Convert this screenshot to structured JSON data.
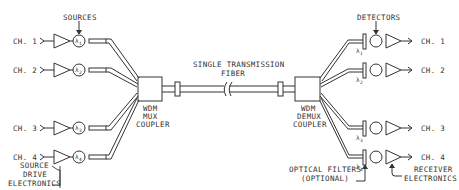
{
  "diagram": {
    "title_labels": {
      "sources": "SOURCES",
      "detectors": "DETECTORS",
      "fiber_line1": "SINGLE TRANSMISSION",
      "fiber_line2": "FIBER",
      "mux_line1": "WDM",
      "mux_line2": "MUX",
      "mux_line3": "COUPLER",
      "demux_line1": "WDM",
      "demux_line2": "DEMUX",
      "demux_line3": "COUPLER",
      "drive_line1": "SOURCE",
      "drive_line2": "DRIVE",
      "drive_line3": "ELECTRONICS",
      "filters_line1": "OPTICAL FILTERS",
      "filters_line2": "(OPTIONAL)",
      "receiver_line1": "RECEIVER",
      "receiver_line2": "ELECTRONICS"
    },
    "input_channels": [
      {
        "label": "CH. 1",
        "wavelength": "λ",
        "sub": "1"
      },
      {
        "label": "CH. 2",
        "wavelength": "λ",
        "sub": "2"
      },
      {
        "label": "CH. 3",
        "wavelength": "λ",
        "sub": "3"
      },
      {
        "label": "CH. 4",
        "wavelength": "λ",
        "sub": "4"
      }
    ],
    "output_channels": [
      {
        "label": "CH. 1",
        "wavelength": "λ",
        "sub": "1"
      },
      {
        "label": "CH. 2",
        "wavelength": "λ",
        "sub": "2"
      },
      {
        "label": "CH. 3",
        "wavelength": "λ",
        "sub": "3"
      },
      {
        "label": "CH. 4",
        "wavelength": "λ",
        "sub": "4"
      }
    ],
    "colors": {
      "line": "#333333",
      "background": "#ffffff"
    }
  }
}
